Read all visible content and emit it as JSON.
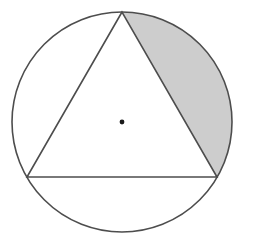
{
  "figure": {
    "background_color": "#ffffff",
    "stroke_color": "#4d4d4d",
    "shade_color": "#cdcdcd",
    "center_dot_color": "#1a1a1a",
    "canvas": {
      "width": 253,
      "height": 241
    }
  },
  "chart_data": {
    "type": "diagram",
    "title": "",
    "xlabel": "",
    "ylabel": "",
    "grid": false,
    "legend": "none",
    "shapes": [
      {
        "name": "circle",
        "kind": "circle",
        "center": [
          122,
          122
        ],
        "radius": 110,
        "stroke": "#4d4d4d",
        "stroke_width": 1.6,
        "fill": "none"
      },
      {
        "name": "inscribed-equilateral-triangle",
        "kind": "polygon",
        "vertices": [
          [
            122,
            12
          ],
          [
            27,
            177
          ],
          [
            217,
            177
          ]
        ],
        "vertex_angles_deg": [
          90,
          210,
          330
        ],
        "stroke": "#4d4d4d",
        "stroke_width": 1.6,
        "fill": "none"
      },
      {
        "name": "shaded-circular-segment",
        "kind": "circular-segment",
        "chord_endpoints": [
          [
            122,
            12
          ],
          [
            217,
            177
          ]
        ],
        "arc_sweep_deg": 120,
        "fill": "#cdcdcd",
        "stroke": "none"
      },
      {
        "name": "center-point",
        "kind": "dot",
        "center": [
          122,
          122
        ],
        "radius": 2.4,
        "fill": "#1a1a1a"
      }
    ],
    "labels": [],
    "annotations": []
  }
}
